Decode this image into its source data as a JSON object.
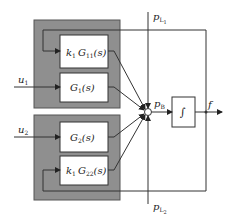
{
  "diagram": {
    "colors": {
      "group_fill": "#8f8f8f",
      "line": "#333333",
      "block_fill": "#ffffff"
    },
    "groups": [
      {
        "id": "group-1"
      },
      {
        "id": "group-2"
      }
    ],
    "blocks": [
      {
        "id": "k1G11",
        "k": "k",
        "k_sub": "1",
        "g": "G",
        "g_sub": "11",
        "arg": "(s)"
      },
      {
        "id": "G1",
        "g": "G",
        "g_sub": "1",
        "arg": "(s)"
      },
      {
        "id": "G2",
        "g": "G",
        "g_sub": "2",
        "arg": "(s)"
      },
      {
        "id": "k1G22",
        "k": "k",
        "k_sub": "1",
        "g": "G",
        "g_sub": "22",
        "arg": "(s)"
      },
      {
        "id": "integrator",
        "symbol": "∫"
      }
    ],
    "signals": {
      "u1": {
        "main": "u",
        "sub": "1"
      },
      "u2": {
        "main": "u",
        "sub": "2"
      },
      "pL1": {
        "main": "p",
        "sub": "L",
        "subsub": "1"
      },
      "pL2": {
        "main": "p",
        "sub": "L",
        "subsub": "2"
      },
      "pB": {
        "main": "p",
        "sub": "B"
      },
      "f": {
        "main": "f"
      }
    }
  }
}
